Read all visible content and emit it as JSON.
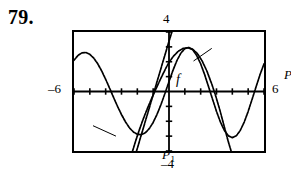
{
  "figure": {
    "problem_number": "79.",
    "kind": "graphing-calculator-window"
  },
  "window_labels": {
    "x_min": "–6",
    "x_max": "6",
    "y_max": "4",
    "y_min": "–4"
  },
  "curve_labels": {
    "f": "f",
    "p1_name": "P",
    "p1_sub": "1",
    "p2_name": "P",
    "p2_sub": "2"
  },
  "colors": {
    "ink": "#000000",
    "background": "#ffffff"
  },
  "chart_data": {
    "type": "line",
    "title": "",
    "xlabel": "",
    "ylabel": "",
    "xlim": [
      -6,
      6
    ],
    "ylim": [
      -4,
      4
    ],
    "grid": false,
    "legend": "inline-annotations",
    "x_tick_step": 1,
    "y_tick_step": 1,
    "annotations": [
      {
        "text": "f",
        "x": -3.9,
        "y": 2.55
      },
      {
        "text": "P1",
        "x": -4.8,
        "y": -2.3,
        "leader_to": {
          "x": -3.35,
          "y": -3.0
        }
      },
      {
        "text": "P2",
        "x": 2.7,
        "y": 2.9,
        "leader_to": {
          "x": 1.55,
          "y": 2.05
        }
      }
    ],
    "series": [
      {
        "name": "f",
        "label": "f",
        "style": "solid",
        "points": [
          [
            -6.0,
            2.1
          ],
          [
            -5.75,
            2.42
          ],
          [
            -5.5,
            2.6
          ],
          [
            -5.25,
            2.62
          ],
          [
            -5.0,
            2.5
          ],
          [
            -4.75,
            2.24
          ],
          [
            -4.5,
            1.86
          ],
          [
            -4.25,
            1.38
          ],
          [
            -4.0,
            0.82
          ],
          [
            -3.75,
            0.22
          ],
          [
            -3.5,
            -0.4
          ],
          [
            -3.25,
            -1.0
          ],
          [
            -3.0,
            -1.55
          ],
          [
            -2.75,
            -2.04
          ],
          [
            -2.5,
            -2.44
          ],
          [
            -2.25,
            -2.72
          ],
          [
            -2.0,
            -2.88
          ],
          [
            -1.75,
            -2.9
          ],
          [
            -1.5,
            -2.78
          ],
          [
            -1.25,
            -2.5
          ],
          [
            -1.0,
            -2.08
          ],
          [
            -0.75,
            -1.52
          ],
          [
            -0.5,
            -0.86
          ],
          [
            -0.25,
            -0.12
          ],
          [
            0.0,
            0.66
          ],
          [
            0.25,
            1.42
          ],
          [
            0.5,
            2.08
          ],
          [
            0.75,
            2.58
          ],
          [
            1.0,
            2.88
          ],
          [
            1.25,
            2.96
          ],
          [
            1.5,
            2.8
          ],
          [
            1.75,
            2.42
          ],
          [
            2.0,
            1.86
          ],
          [
            2.25,
            1.14
          ],
          [
            2.5,
            0.32
          ],
          [
            2.75,
            -0.52
          ],
          [
            3.0,
            -1.34
          ],
          [
            3.25,
            -2.06
          ],
          [
            3.5,
            -2.62
          ],
          [
            3.75,
            -2.98
          ],
          [
            4.0,
            -3.1
          ],
          [
            4.25,
            -2.98
          ],
          [
            4.5,
            -2.62
          ],
          [
            4.75,
            -2.06
          ],
          [
            5.0,
            -1.34
          ],
          [
            5.25,
            -0.52
          ],
          [
            5.5,
            0.32
          ],
          [
            5.75,
            1.14
          ],
          [
            6.0,
            1.86
          ]
        ]
      },
      {
        "name": "P1",
        "label": "P1",
        "style": "solid",
        "points": [
          [
            -2.05,
            -4.0
          ],
          [
            -1.8,
            -3.1
          ],
          [
            -1.55,
            -2.2
          ],
          [
            -1.3,
            -1.3
          ],
          [
            -1.05,
            -0.4
          ],
          [
            -0.8,
            0.5
          ],
          [
            -0.55,
            1.4
          ],
          [
            -0.3,
            2.3
          ],
          [
            -0.05,
            3.2
          ],
          [
            0.18,
            4.0
          ]
        ]
      },
      {
        "name": "P2",
        "label": "P2",
        "style": "solid",
        "points": [
          [
            -2.3,
            -4.0
          ],
          [
            -2.1,
            -3.3
          ],
          [
            -1.9,
            -2.66
          ],
          [
            -1.7,
            -2.06
          ],
          [
            -1.5,
            -1.5
          ],
          [
            -1.3,
            -0.98
          ],
          [
            -1.1,
            -0.48
          ],
          [
            -0.9,
            0.0
          ],
          [
            -0.7,
            0.46
          ],
          [
            -0.5,
            0.92
          ],
          [
            -0.25,
            1.46
          ],
          [
            0.0,
            1.96
          ],
          [
            0.3,
            2.4
          ],
          [
            0.6,
            2.72
          ],
          [
            0.9,
            2.9
          ],
          [
            1.2,
            2.94
          ],
          [
            1.5,
            2.84
          ],
          [
            1.8,
            2.54
          ],
          [
            2.1,
            2.04
          ],
          [
            2.4,
            1.36
          ],
          [
            2.7,
            0.5
          ],
          [
            2.95,
            -0.3
          ],
          [
            3.2,
            -1.2
          ],
          [
            3.45,
            -2.2
          ],
          [
            3.7,
            -3.2
          ],
          [
            3.92,
            -4.0
          ]
        ]
      }
    ]
  }
}
